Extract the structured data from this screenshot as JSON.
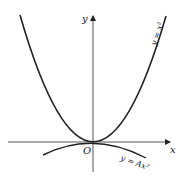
{
  "diagram": {
    "axes": {
      "x_label": "x",
      "y_label": "y",
      "origin_label": "O"
    },
    "curves": [
      {
        "name": "upper-parabola",
        "label": "y = x²",
        "equation": "y = x^2",
        "opens": "up"
      },
      {
        "name": "lower-parabola",
        "label": "y = Ax²",
        "equation": "y = Ax^2",
        "opens": "down"
      }
    ],
    "colors": {
      "stroke": "#222222",
      "background": "#ffffff"
    }
  }
}
